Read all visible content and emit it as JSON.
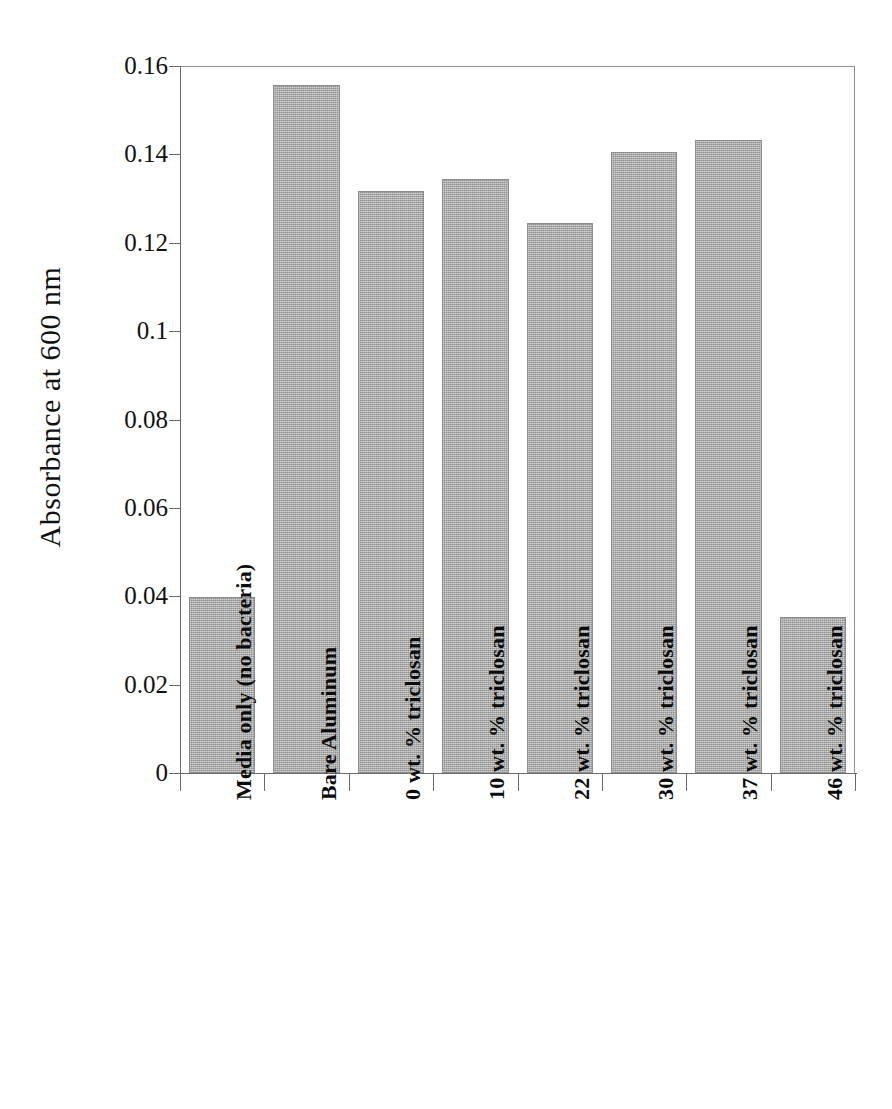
{
  "chart_data": {
    "type": "bar",
    "title": "",
    "subtitle": "",
    "xlabel": "",
    "ylabel": "Absorbance at 600 nm",
    "ylim": [
      0,
      0.16
    ],
    "ytick_labels": [
      "0.16",
      "0.14",
      "0.12",
      "0.1",
      "0.08",
      "0.06",
      "0.04",
      "0.02",
      "0"
    ],
    "ytick_values": [
      0.16,
      0.14,
      0.12,
      0.1,
      0.08,
      0.06,
      0.04,
      0.02,
      0
    ],
    "grid": false,
    "legend": false,
    "legend_position": "none",
    "bar_color": "#a2a2a2",
    "bar_edge_color": "#8d8d8d",
    "categories": [
      "Media only (no bacteria)",
      "Bare Aluminum",
      "0 wt. % triclosan",
      "10 wt. % triclosan",
      "22 wt. % triclosan",
      "30 wt. % triclosan",
      "37 wt. % triclosan",
      "46 wt. % triclosan"
    ],
    "values": [
      0.0399,
      0.1558,
      0.1318,
      0.1345,
      0.1244,
      0.1406,
      0.1432,
      0.0352
    ],
    "annotations": []
  }
}
